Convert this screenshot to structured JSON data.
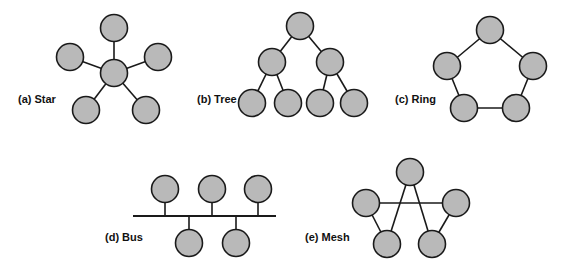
{
  "figure": {
    "width": 566,
    "height": 270,
    "background_color": "#ffffff",
    "node_fill_color": "#b9b9b9",
    "node_stroke_color": "#1a1a1a",
    "edge_color": "#1a1a1a",
    "label_color": "#111111",
    "node_radius": 13.5
  },
  "panels": [
    {
      "id": "star",
      "label": "(a) Star",
      "label_x": 18,
      "label_y": 100,
      "description": "Five peripheral nodes each connected to one central hub node",
      "node_count": 6,
      "edge_count": 5,
      "nodes": [
        {
          "name": "star-hub",
          "x": 114,
          "y": 73
        },
        {
          "name": "star-top",
          "x": 114,
          "y": 28
        },
        {
          "name": "star-left",
          "x": 70,
          "y": 57
        },
        {
          "name": "star-right",
          "x": 158,
          "y": 57
        },
        {
          "name": "star-lower-left",
          "x": 86,
          "y": 110
        },
        {
          "name": "star-lower-right",
          "x": 146,
          "y": 110
        }
      ],
      "edges": [
        {
          "from": 0,
          "to": 1
        },
        {
          "from": 0,
          "to": 2
        },
        {
          "from": 0,
          "to": 3
        },
        {
          "from": 0,
          "to": 4
        },
        {
          "from": 0,
          "to": 5
        }
      ]
    },
    {
      "id": "tree",
      "label": "(b) Tree",
      "label_x": 197,
      "label_y": 100,
      "description": "Binary tree with one root, two internal nodes and four leaf nodes",
      "node_count": 7,
      "edge_count": 6,
      "nodes": [
        {
          "name": "tree-root",
          "x": 300,
          "y": 26
        },
        {
          "name": "tree-internal-left",
          "x": 272,
          "y": 62
        },
        {
          "name": "tree-internal-right",
          "x": 330,
          "y": 62
        },
        {
          "name": "tree-leaf-1",
          "x": 252,
          "y": 103
        },
        {
          "name": "tree-leaf-2",
          "x": 288,
          "y": 103
        },
        {
          "name": "tree-leaf-3",
          "x": 320,
          "y": 103
        },
        {
          "name": "tree-leaf-4",
          "x": 354,
          "y": 103
        }
      ],
      "edges": [
        {
          "from": 0,
          "to": 1
        },
        {
          "from": 0,
          "to": 2
        },
        {
          "from": 1,
          "to": 3
        },
        {
          "from": 1,
          "to": 4
        },
        {
          "from": 2,
          "to": 5
        },
        {
          "from": 2,
          "to": 6
        }
      ]
    },
    {
      "id": "ring",
      "label": "(c) Ring",
      "label_x": 395,
      "label_y": 100,
      "description": "Five nodes connected in a closed pentagon loop",
      "node_count": 5,
      "edge_count": 5,
      "nodes": [
        {
          "name": "ring-top",
          "x": 490,
          "y": 30
        },
        {
          "name": "ring-upper-right",
          "x": 533,
          "y": 66
        },
        {
          "name": "ring-lower-right",
          "x": 516,
          "y": 108
        },
        {
          "name": "ring-lower-left",
          "x": 464,
          "y": 108
        },
        {
          "name": "ring-upper-left",
          "x": 447,
          "y": 66
        }
      ],
      "edges": [
        {
          "from": 0,
          "to": 1
        },
        {
          "from": 1,
          "to": 2
        },
        {
          "from": 2,
          "to": 3
        },
        {
          "from": 3,
          "to": 4
        },
        {
          "from": 4,
          "to": 0
        }
      ]
    },
    {
      "id": "bus",
      "label": "(d) Bus",
      "label_x": 105,
      "label_y": 238,
      "description": "Shared horizontal backbone with three nodes above and two below",
      "node_count": 5,
      "edge_count": 5,
      "backbone": {
        "x1": 133,
        "y1": 216,
        "x2": 276,
        "y2": 216
      },
      "nodes": [
        {
          "name": "bus-top-1",
          "x": 165,
          "y": 189
        },
        {
          "name": "bus-top-2",
          "x": 212,
          "y": 189
        },
        {
          "name": "bus-top-3",
          "x": 258,
          "y": 189
        },
        {
          "name": "bus-bottom-1",
          "x": 189,
          "y": 243
        },
        {
          "name": "bus-bottom-2",
          "x": 236,
          "y": 243
        }
      ],
      "stubs": [
        {
          "x": 165,
          "y_node": 189,
          "y_bus": 216
        },
        {
          "x": 212,
          "y_node": 189,
          "y_bus": 216
        },
        {
          "x": 258,
          "y_node": 189,
          "y_bus": 216
        },
        {
          "x": 189,
          "y_node": 243,
          "y_bus": 216
        },
        {
          "x": 236,
          "y_node": 243,
          "y_bus": 216
        }
      ]
    },
    {
      "id": "mesh",
      "label": "(e) Mesh",
      "label_x": 305,
      "label_y": 238,
      "description": "Five nodes interconnected in a pentagram pattern with crossing links",
      "node_count": 5,
      "edge_count": 5,
      "nodes": [
        {
          "name": "mesh-top",
          "x": 410,
          "y": 172
        },
        {
          "name": "mesh-left",
          "x": 366,
          "y": 203
        },
        {
          "name": "mesh-right",
          "x": 456,
          "y": 203
        },
        {
          "name": "mesh-bottom-left",
          "x": 387,
          "y": 244
        },
        {
          "name": "mesh-bottom-right",
          "x": 432,
          "y": 244
        }
      ],
      "edges": [
        {
          "from": 0,
          "to": 3
        },
        {
          "from": 0,
          "to": 4
        },
        {
          "from": 1,
          "to": 2
        },
        {
          "from": 1,
          "to": 3
        },
        {
          "from": 2,
          "to": 4
        }
      ]
    }
  ]
}
